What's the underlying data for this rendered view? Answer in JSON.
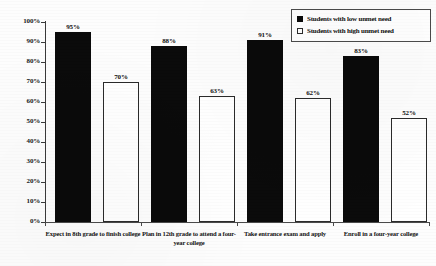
{
  "chart_data": {
    "type": "bar",
    "title": "",
    "subtitle": "",
    "xlabel": "",
    "ylabel": "",
    "ylim": [
      0,
      100
    ],
    "grid": false,
    "legend_position": "top-right-inside",
    "y_ticks": [
      "0%",
      "10%",
      "20%",
      "30%",
      "40%",
      "50%",
      "60%",
      "70%",
      "80%",
      "90%",
      "100%"
    ],
    "y_tick_values": [
      0,
      10,
      20,
      30,
      40,
      50,
      60,
      70,
      80,
      90,
      100
    ],
    "categories": [
      "Expect in 8th grade to finish college",
      "Plan in 12th grade to attend a four-year college",
      "Take entrance exam and apply",
      "Enroll in a four-year college"
    ],
    "series": [
      {
        "name": "Students with low unmet need",
        "color": "#0b0b0b",
        "values": [
          95,
          88,
          91,
          83
        ],
        "labels": [
          "95%",
          "88%",
          "91%",
          "83%"
        ]
      },
      {
        "name": "Students with high unmet need",
        "color": "#ffffff",
        "values": [
          70,
          63,
          62,
          52
        ],
        "labels": [
          "70%",
          "63%",
          "62%",
          "52%"
        ]
      }
    ]
  },
  "legend": {
    "items": [
      {
        "label": "Students with low unmet need",
        "swatch": "filled-square-icon"
      },
      {
        "label": "Students with high unmet need",
        "swatch": "empty-square-icon"
      }
    ]
  }
}
